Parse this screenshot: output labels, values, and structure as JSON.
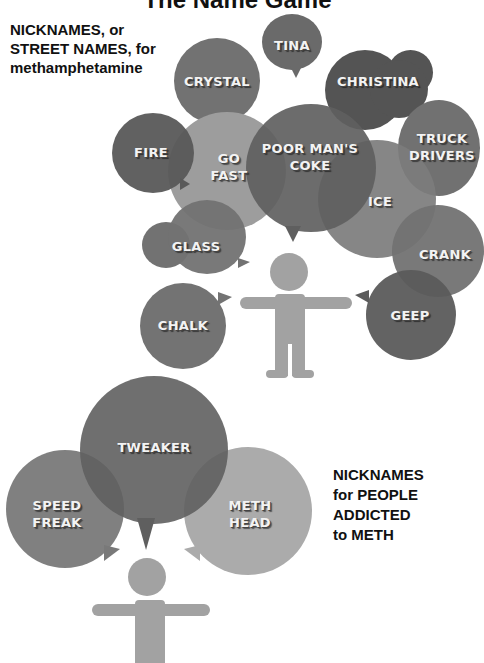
{
  "title": "The Name Game",
  "street_names_caption": [
    "NICKNAMES, or",
    "STREET NAMES, for",
    "methamphetamine"
  ],
  "street_names": [
    {
      "label": "TINA"
    },
    {
      "label": "CRYSTAL"
    },
    {
      "label": "CHRISTINA"
    },
    {
      "label": "FIRE"
    },
    {
      "label": "GO FAST",
      "lines": [
        "GO",
        "FAST"
      ]
    },
    {
      "label": "POOR MAN'S COKE",
      "lines": [
        "POOR MAN'S",
        "COKE"
      ]
    },
    {
      "label": "TRUCK DRIVERS",
      "lines": [
        "TRUCK",
        "DRIVERS"
      ]
    },
    {
      "label": "ICE"
    },
    {
      "label": "GLASS"
    },
    {
      "label": "CRANK"
    },
    {
      "label": "CHALK"
    },
    {
      "label": "GEEP"
    }
  ],
  "people_caption": [
    "NICKNAMES",
    "for PEOPLE",
    "ADDICTED",
    "to METH"
  ],
  "people_names": [
    {
      "label": "TWEAKER"
    },
    {
      "label": "SPEED FREAK",
      "lines": [
        "SPEED",
        "FREAK"
      ]
    },
    {
      "label": "METH HEAD",
      "lines": [
        "METH",
        "HEAD"
      ]
    }
  ],
  "colors": {
    "dark": "#555555",
    "mid": "#6e6e6e",
    "light": "#9a9a9a",
    "lighter": "#b0b0b0",
    "figure": "#a2a2a2"
  }
}
